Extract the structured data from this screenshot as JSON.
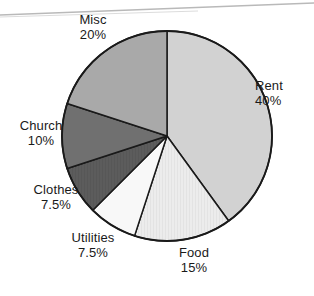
{
  "chart_data": {
    "type": "pie",
    "title": "",
    "xlabel": "",
    "ylabel": "",
    "legend_position": "outside-labels",
    "grid": false,
    "start_angle_deg": 0,
    "direction": "clockwise",
    "categories": [
      "Rent",
      "Food",
      "Utilities",
      "Clothes",
      "Church",
      "Misc"
    ],
    "values": [
      40,
      15,
      7.5,
      7.5,
      10,
      20
    ],
    "value_unit": "%",
    "slices": [
      {
        "name": "Rent",
        "value": 40,
        "value_label": "40%",
        "color": "#d2d2d2",
        "start_deg": 0,
        "end_deg": 144
      },
      {
        "name": "Food",
        "value": 15,
        "value_label": "15%",
        "color": "#ececec",
        "start_deg": 144,
        "end_deg": 198
      },
      {
        "name": "Utilities",
        "value": 7.5,
        "value_label": "7.5%",
        "color": "#f8f8f8",
        "start_deg": 198,
        "end_deg": 225
      },
      {
        "name": "Clothes",
        "value": 7.5,
        "value_label": "7.5%",
        "color": "#5c5c5c",
        "start_deg": 225,
        "end_deg": 252
      },
      {
        "name": "Church",
        "value": 10,
        "value_label": "10%",
        "color": "#707070",
        "start_deg": 252,
        "end_deg": 288
      },
      {
        "name": "Misc",
        "value": 20,
        "value_label": "20%",
        "color": "#a9a9a9",
        "start_deg": 288,
        "end_deg": 360
      }
    ],
    "geometry": {
      "cx": 167,
      "cy": 136,
      "r": 105
    },
    "stroke_color": "#1a1a1a"
  },
  "labels": {
    "rent": {
      "name": "Rent",
      "value": "40%"
    },
    "food": {
      "name": "Food",
      "value": "15%"
    },
    "utilities": {
      "name": "Utilities",
      "value": "7.5%"
    },
    "clothes": {
      "name": "Clothes",
      "value": "7.5%"
    },
    "church": {
      "name": "Church",
      "value": "10%"
    },
    "misc": {
      "name": "Misc",
      "value": "20%"
    }
  }
}
